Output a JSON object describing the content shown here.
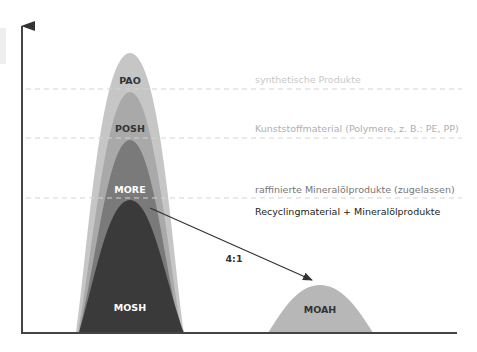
{
  "diagram": {
    "peaks": {
      "pao": {
        "label": "PAO",
        "color": "#c6c6c6"
      },
      "posh": {
        "label": "POSH",
        "color": "#a9a9a9"
      },
      "more": {
        "label": "MORE",
        "color": "#7a7a7a"
      },
      "mosh": {
        "label": "MOSH",
        "color": "#3a3a3a"
      },
      "moah": {
        "label": "MOAH",
        "color": "#b7b7b7"
      }
    },
    "ratio_label": "4:1",
    "levels": [
      {
        "label": "synthetische Produkte",
        "color": "#c8c8c8"
      },
      {
        "label": "Kunststoffmaterial (Polymere, z. B.: PE, PP)",
        "color": "#b0b0b0"
      },
      {
        "label": "raffinierte Mineralölprodukte (zugelassen)",
        "color": "#777777"
      },
      {
        "label": "Recyclingmaterial + Mineralölprodukte",
        "color": "#222222"
      }
    ],
    "axis_color": "#444444",
    "dash_color": "#d4d4d4"
  }
}
